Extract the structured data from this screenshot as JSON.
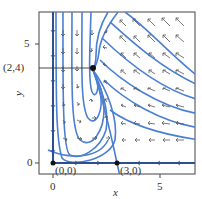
{
  "diagram": {
    "type": "phase_portrait",
    "x_axis": {
      "label": "x",
      "ticks": [
        {
          "value": 0,
          "label": "0"
        },
        {
          "value": 5,
          "label": "5"
        }
      ],
      "range": [
        -0.65,
        6.65
      ]
    },
    "y_axis": {
      "label": "y",
      "ticks": [
        {
          "value": 0,
          "label": "0"
        },
        {
          "value": 5,
          "label": "5"
        }
      ],
      "range": [
        -0.45,
        6.35
      ]
    },
    "equilibria": [
      {
        "label": "(0,0)",
        "x": 0,
        "y": 0
      },
      {
        "label": "(3,0)",
        "x": 3,
        "y": 0
      },
      {
        "label": "(2,4)",
        "x": 2,
        "y": 4
      }
    ],
    "guide_label": "(2,4)",
    "colors": {
      "trajectory": "#4a7fd4",
      "axis_trajectory": "#2e4f8f",
      "arrow": "#555555",
      "frame": "#444444",
      "point": "#111111"
    }
  }
}
